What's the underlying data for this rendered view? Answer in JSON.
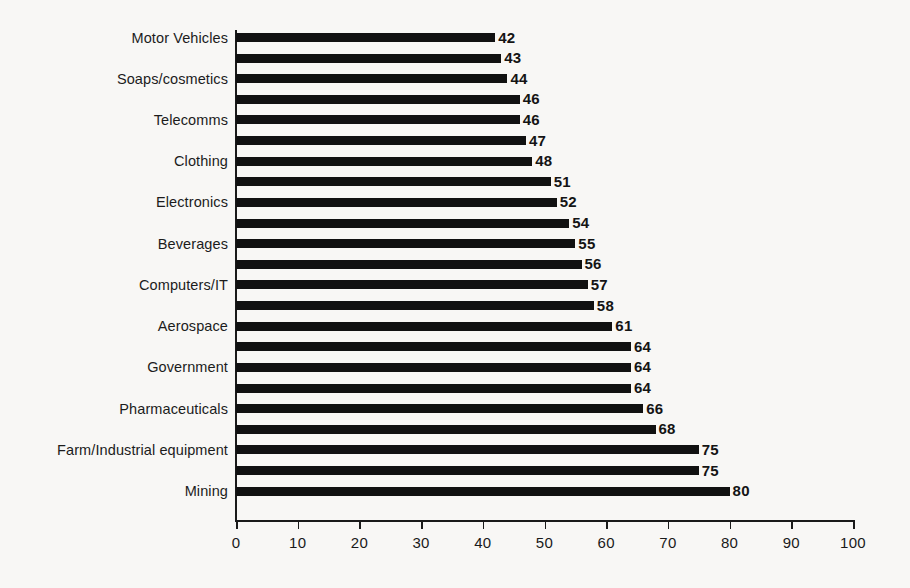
{
  "chart_data": {
    "type": "bar",
    "orientation": "horizontal",
    "title": "",
    "subtitle": "",
    "xlabel": "",
    "ylabel": "",
    "xlim": [
      0,
      100
    ],
    "xticks": [
      0,
      10,
      20,
      30,
      40,
      50,
      60,
      70,
      80,
      90,
      100
    ],
    "xtick_labels": [
      "0",
      "10",
      "20",
      "30",
      "40",
      "50",
      "60",
      "70",
      "80",
      "90",
      "100"
    ],
    "grid": false,
    "legend": null,
    "bar_color": "#111111",
    "background_color": "#f8f7f5",
    "axis_color": "#1a1a1a",
    "note": "Category labels appear on alternating bars only; unlabeled bars are shown with an empty label.",
    "categories": [
      "Motor Vehicles",
      "",
      "Soaps/cosmetics",
      "",
      "Telecomms",
      "",
      "Clothing",
      "",
      "Electronics",
      "",
      "Beverages",
      "",
      "Computers/IT",
      "",
      "Aerospace",
      "",
      "Government",
      "",
      "Pharmaceuticals",
      "",
      "Farm/Industrial equipment",
      "",
      "Mining"
    ],
    "values": [
      42,
      43,
      44,
      46,
      46,
      47,
      48,
      51,
      52,
      54,
      55,
      56,
      57,
      58,
      61,
      64,
      64,
      64,
      66,
      68,
      75,
      75,
      80
    ],
    "value_labels": [
      "42",
      "43",
      "44",
      "46",
      "46",
      "47",
      "48",
      "51",
      "52",
      "54",
      "55",
      "56",
      "57",
      "58",
      "61",
      "64",
      "64",
      "64",
      "66",
      "68",
      "75",
      "75",
      "80"
    ]
  }
}
